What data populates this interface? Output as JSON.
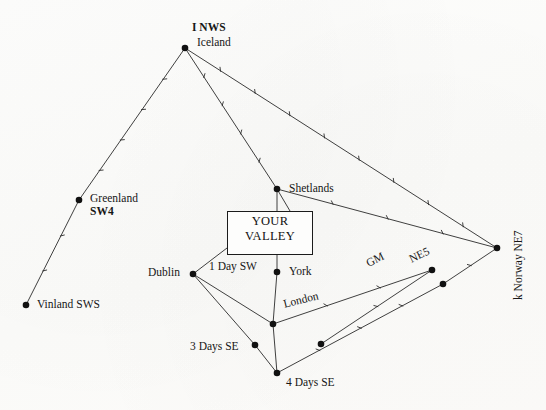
{
  "figure": {
    "background_color": "#fdfdfc",
    "line_color": "#2a2a2a",
    "node_color": "#111111",
    "width": 546,
    "height": 410
  },
  "center_box": {
    "line1": "YOUR",
    "line2": "VALLEY",
    "x": 227,
    "y": 211,
    "width": 74,
    "height": 37
  },
  "chart_data": {
    "type": "diagram",
    "nodes": [
      {
        "id": "iceland",
        "label": "Iceland",
        "sublabel": "I NWS",
        "x": 185,
        "y": 48,
        "label_x": 197,
        "label_y": 36,
        "sub_x": 192,
        "sub_y": 21
      },
      {
        "id": "greenland",
        "label": "Greenland",
        "sublabel": "SW4",
        "x": 79,
        "y": 200,
        "label_x": 90,
        "label_y": 192,
        "sub_x": 90,
        "sub_y": 205
      },
      {
        "id": "vinland",
        "label": "Vinland SWS",
        "sublabel": "",
        "x": 26,
        "y": 305,
        "label_x": 37,
        "label_y": 298,
        "sub_x": 0,
        "sub_y": 0
      },
      {
        "id": "shetlands",
        "label": "Shetlands",
        "sublabel": "",
        "x": 277,
        "y": 189,
        "label_x": 289,
        "label_y": 182,
        "sub_x": 0,
        "sub_y": 0
      },
      {
        "id": "york",
        "label": "York",
        "sublabel": "",
        "x": 277,
        "y": 272,
        "label_x": 289,
        "label_y": 265,
        "sub_x": 0,
        "sub_y": 0
      },
      {
        "id": "dublin",
        "label": "Dublin",
        "sublabel": "",
        "x": 193,
        "y": 274,
        "label_x": 148,
        "label_y": 266,
        "sub_x": 0,
        "sub_y": 0
      },
      {
        "id": "london",
        "label": "",
        "sublabel": "",
        "x": 273,
        "y": 324,
        "label_x": 0,
        "label_y": 0,
        "sub_x": 0,
        "sub_y": 0
      },
      {
        "id": "threedays",
        "label": "",
        "sublabel": "",
        "x": 255,
        "y": 345,
        "label_x": 0,
        "label_y": 0,
        "sub_x": 0,
        "sub_y": 0
      },
      {
        "id": "fourdays",
        "label": "",
        "sublabel": "",
        "x": 277,
        "y": 373,
        "label_x": 0,
        "label_y": 0,
        "sub_x": 0,
        "sub_y": 0
      },
      {
        "id": "midsouth",
        "label": "",
        "sublabel": "",
        "x": 321,
        "y": 344,
        "label_x": 0,
        "label_y": 0,
        "sub_x": 0,
        "sub_y": 0
      },
      {
        "id": "ne5",
        "label": "",
        "sublabel": "",
        "x": 432,
        "y": 270,
        "label_x": 0,
        "label_y": 0,
        "sub_x": 0,
        "sub_y": 0
      },
      {
        "id": "ne5b",
        "label": "",
        "sublabel": "",
        "x": 443,
        "y": 284,
        "label_x": 0,
        "label_y": 0,
        "sub_x": 0,
        "sub_y": 0
      },
      {
        "id": "norway",
        "label": "",
        "sublabel": "",
        "x": 497,
        "y": 248,
        "label_x": 0,
        "label_y": 0,
        "sub_x": 0,
        "sub_y": 0
      }
    ],
    "edges": [
      {
        "from": "iceland",
        "to": "greenland",
        "ticks": 4
      },
      {
        "from": "greenland",
        "to": "vinland",
        "ticks": 2
      },
      {
        "from": "iceland",
        "to": "shetlands",
        "ticks": 4
      },
      {
        "from": "iceland",
        "to": "norway",
        "ticks": 8
      },
      {
        "from": "shetlands",
        "to": "valleybox",
        "ticks": 0
      },
      {
        "from": "shetlands",
        "to": "york",
        "ticks": 0
      },
      {
        "from": "shetlands",
        "to": "norway",
        "ticks": 3
      },
      {
        "from": "dublin",
        "to": "valleybox",
        "ticks": 0
      },
      {
        "from": "dublin",
        "to": "london",
        "ticks": 0
      },
      {
        "from": "dublin",
        "to": "threedays",
        "ticks": 0
      },
      {
        "from": "york",
        "to": "london",
        "ticks": 0
      },
      {
        "from": "london",
        "to": "fourdays",
        "ticks": 0
      },
      {
        "from": "threedays",
        "to": "fourdays",
        "ticks": 0
      },
      {
        "from": "london",
        "to": "ne5",
        "ticks": 2
      },
      {
        "from": "fourdays",
        "to": "ne5b",
        "ticks": 3
      },
      {
        "from": "midsouth",
        "to": "ne5",
        "ticks": 1
      },
      {
        "from": "ne5b",
        "to": "norway",
        "ticks": 1
      }
    ],
    "annotations": [
      {
        "id": "one-day-sw",
        "text": "1 Day SW",
        "x": 209,
        "y": 260,
        "rotation": 0
      },
      {
        "id": "three-days-se",
        "text": "3 Days SE",
        "x": 190,
        "y": 340,
        "rotation": 0
      },
      {
        "id": "four-days-se",
        "text": "4 Days SE",
        "x": 286,
        "y": 376,
        "rotation": 0
      },
      {
        "id": "london",
        "text": "London",
        "x": 282,
        "y": 298,
        "rotation": -14
      },
      {
        "id": "gm",
        "text": "GM",
        "x": 364,
        "y": 258,
        "rotation": -26
      },
      {
        "id": "ne5",
        "text": "NE5",
        "x": 407,
        "y": 254,
        "rotation": -26
      },
      {
        "id": "norway",
        "text": "k Norway NE7",
        "x": 512,
        "y": 300,
        "rotation": -90
      }
    ]
  }
}
